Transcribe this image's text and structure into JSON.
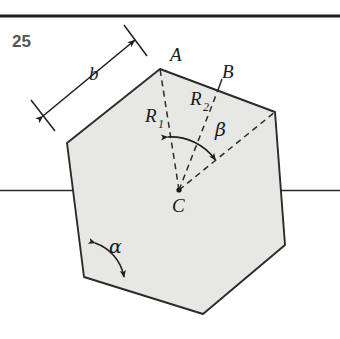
{
  "figure": {
    "exercise_number": "25",
    "colors": {
      "polygon_fill": "#e7e7e4",
      "stroke": "#2b2b2b",
      "rule": "#1c1c1c",
      "number_text": "#55565a",
      "label_text": "#1a1a1a"
    },
    "top_rule": {
      "name": "header-rule",
      "y": 16,
      "thickness": 3
    },
    "horizontal_axis": {
      "name": "horizontal-axis-line",
      "y": 190,
      "x_start": 0,
      "x_end": 340
    },
    "center": {
      "label": "C",
      "x": 179,
      "y": 190
    },
    "polygon_points": "160,69 275,112 285,245 203,314 84,277 67,143",
    "vertices": [
      {
        "name": "vertex-a",
        "label": "A",
        "x": 160,
        "y": 69
      },
      {
        "name": "vertex-upper-right",
        "label": "",
        "x": 275,
        "y": 112
      },
      {
        "name": "vertex-right",
        "label": "",
        "x": 285,
        "y": 245
      },
      {
        "name": "vertex-bottom",
        "label": "",
        "x": 203,
        "y": 314
      },
      {
        "name": "vertex-bottom-left",
        "label": "",
        "x": 84,
        "y": 277
      },
      {
        "name": "vertex-left",
        "label": "",
        "x": 67,
        "y": 143
      }
    ],
    "labels": {
      "A": {
        "text": "A",
        "x": 170,
        "y": 61
      },
      "B": {
        "text": "B",
        "x": 222,
        "y": 78
      },
      "C": {
        "text": "C",
        "x": 172,
        "y": 212
      },
      "R1": {
        "text": "R",
        "sub": "1",
        "x": 145,
        "y": 122
      },
      "R2": {
        "text": "R",
        "sub": "2",
        "x": 190,
        "y": 105
      },
      "b": {
        "text": "b",
        "x": 89,
        "y": 80
      },
      "alpha": {
        "text": "α",
        "x": 109,
        "y": 253
      },
      "beta": {
        "text": "β",
        "x": 215,
        "y": 136
      }
    },
    "radii": [
      {
        "name": "radius-r1-to-a",
        "from": "C",
        "to": "A",
        "style": "dashed"
      },
      {
        "name": "radius-r2-to-b",
        "from": "C",
        "to": "B",
        "style": "dashed"
      },
      {
        "name": "radius-to-upper-right-vertex",
        "from": "C",
        "to": "vertex-upper-right",
        "style": "dashed"
      }
    ],
    "midpoint_b": {
      "x": 218,
      "y": 90
    },
    "angle_arcs": [
      {
        "name": "beta-arc",
        "at": "C",
        "label": "β",
        "arrowheads": "both"
      },
      {
        "name": "alpha-arc",
        "at": "vertex-bottom-left",
        "label": "α",
        "arrowheads": "both"
      }
    ],
    "dimension": {
      "name": "side-length-b-dimension",
      "label": "b",
      "arrowheads": "both"
    }
  }
}
